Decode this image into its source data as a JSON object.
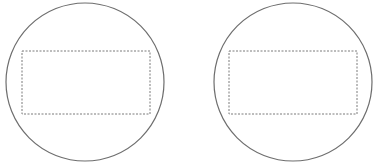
{
  "diagram": {
    "background": "#ffffff",
    "stroke_color": "#6e6e6e",
    "dash_color": "#7a7a7a",
    "shapes": [
      {
        "circle": {
          "cx": 85,
          "cy": 82,
          "r": 79
        },
        "rect": {
          "x": 22,
          "y": 51,
          "width": 128,
          "height": 63
        }
      },
      {
        "circle": {
          "cx": 293,
          "cy": 82,
          "r": 79
        },
        "rect": {
          "x": 229,
          "y": 51,
          "width": 128,
          "height": 63
        }
      }
    ]
  }
}
